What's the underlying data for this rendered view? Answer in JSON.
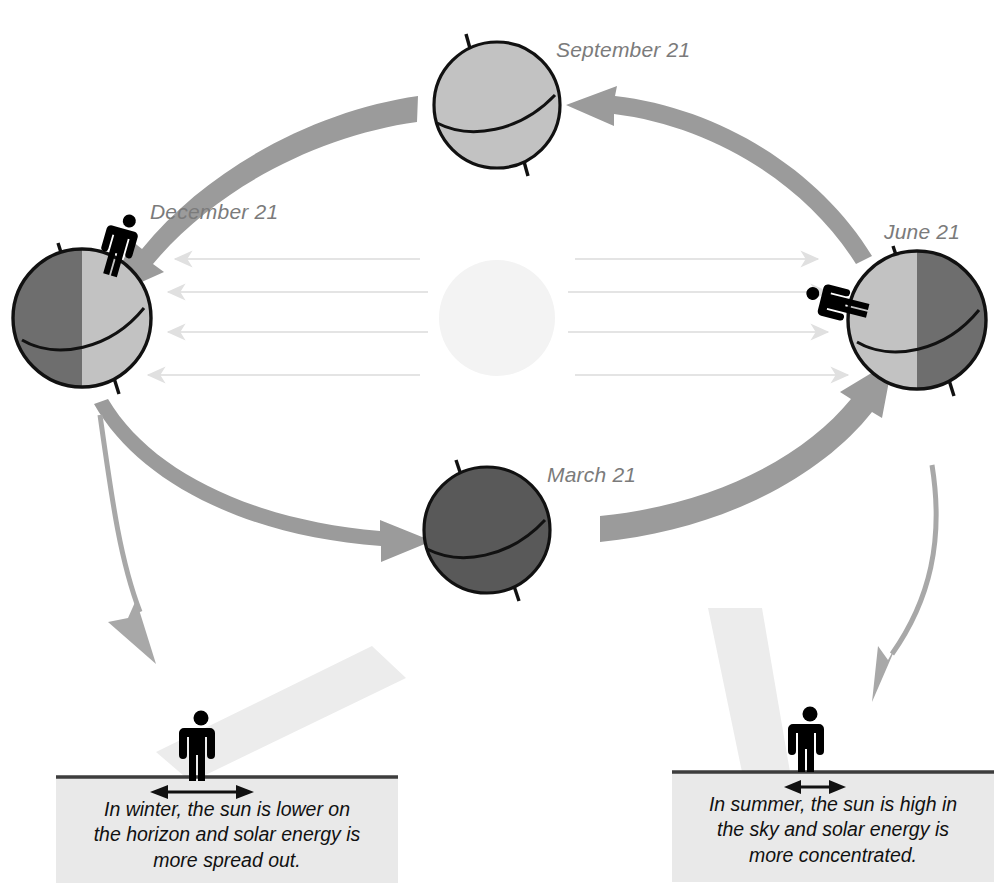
{
  "diagram": {
    "orbit_direction": "counterclockwise"
  },
  "colors": {
    "globe_light": "#c2c2c2",
    "globe_dark": "#6e6e6e",
    "globe_mid": "#b4b4b4",
    "globe_outline": "#111111",
    "sun": "#f3f3f3",
    "orbit_arrow": "#9b9b9b",
    "pointer_arrow": "#a8a8a8",
    "ray_arrow": "#e2e2e2",
    "beam": "#ececec",
    "panel_bg": "#e9e9e9",
    "label_text": "#7b7b7b",
    "caption_text": "#111111",
    "figure": "#000000"
  },
  "sun": {
    "name": "Sun"
  },
  "globes": [
    {
      "id": "september",
      "label": "September 21",
      "lit_side": "none",
      "shading": "uniform-light",
      "has_figure": false,
      "cx": 497,
      "cy": 105,
      "r": 64
    },
    {
      "id": "december",
      "label": "December 21",
      "lit_side": "right",
      "shading": "split",
      "has_figure": true,
      "figure_position": "north-pole-top",
      "cx": 82,
      "cy": 318,
      "r": 70
    },
    {
      "id": "march",
      "label": "March 21",
      "lit_side": "none",
      "shading": "uniform-dark",
      "has_figure": false,
      "cx": 487,
      "cy": 530,
      "r": 64
    },
    {
      "id": "june",
      "label": "June 21",
      "lit_side": "left",
      "shading": "split",
      "has_figure": true,
      "figure_position": "north-pole-left",
      "cx": 917,
      "cy": 320,
      "r": 70
    }
  ],
  "sun_rays": {
    "left_count": 4,
    "right_count": 4,
    "left_direction": "left",
    "right_direction": "right"
  },
  "orbit_arrows": [
    {
      "id": "june-to-september",
      "from": "June 21",
      "to": "September 21"
    },
    {
      "id": "september-to-december",
      "from": "September 21",
      "to": "December 21"
    },
    {
      "id": "december-to-march",
      "from": "December 21",
      "to": "March 21"
    },
    {
      "id": "march-to-june",
      "from": "March 21",
      "to": "June 21"
    }
  ],
  "pointer_arrows": [
    {
      "id": "december-to-winter-panel",
      "points_to": "winter panel"
    },
    {
      "id": "june-to-summer-panel",
      "points_to": "summer panel"
    }
  ],
  "panels": [
    {
      "id": "winter",
      "caption": "In winter, the sun is lower on\nthe horizon and solar energy is\nmore spread out.",
      "beam_angle": "oblique",
      "spread": "wide",
      "figure": "person standing on horizon"
    },
    {
      "id": "summer",
      "caption": "In summer, the sun is high in\nthe sky and solar energy is\nmore concentrated.",
      "beam_angle": "near-vertical",
      "spread": "narrow",
      "figure": "person standing on horizon"
    }
  ]
}
